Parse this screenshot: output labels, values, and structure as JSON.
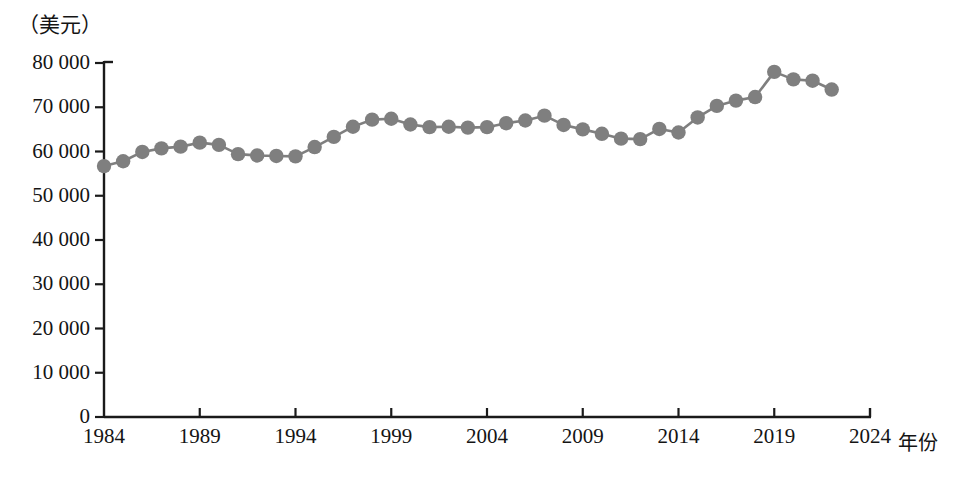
{
  "chart_data": {
    "type": "line",
    "title": "",
    "subtitle": "",
    "unit_label": "（美元）",
    "xlabel": "年份",
    "ylabel": "",
    "grid": false,
    "legend": false,
    "legend_position": "none",
    "marker": "circle",
    "series_color": "#7f7f7f",
    "axis_color": "#1a1a1a",
    "xlim": [
      1984,
      2024
    ],
    "ylim": [
      0,
      80000
    ],
    "xticks": [
      1984,
      1989,
      1994,
      1999,
      2004,
      2009,
      2014,
      2019,
      2024
    ],
    "xtick_labels": [
      "1984",
      "1989",
      "1994",
      "1999",
      "2004",
      "2009",
      "2014",
      "2019",
      "2024"
    ],
    "yticks": [
      0,
      10000,
      20000,
      30000,
      40000,
      50000,
      60000,
      70000,
      80000
    ],
    "ytick_labels": [
      "0",
      "10 000",
      "20 000",
      "30 000",
      "40 000",
      "50 000",
      "60 000",
      "70 000",
      "80 000"
    ],
    "x": [
      1984,
      1985,
      1986,
      1987,
      1988,
      1989,
      1990,
      1991,
      1992,
      1993,
      1994,
      1995,
      1996,
      1997,
      1998,
      1999,
      2000,
      2001,
      2002,
      2003,
      2004,
      2005,
      2006,
      2007,
      2008,
      2009,
      2010,
      2011,
      2012,
      2013,
      2014,
      2015,
      2016,
      2017,
      2018,
      2019,
      2020,
      2021,
      2022
    ],
    "values": [
      56700,
      57800,
      59900,
      60700,
      61100,
      62000,
      61500,
      59400,
      59100,
      59000,
      58900,
      61000,
      63300,
      65600,
      67200,
      67400,
      66100,
      65500,
      65600,
      65400,
      65500,
      66400,
      67000,
      68100,
      66000,
      65000,
      64000,
      62900,
      62800,
      65100,
      64300,
      67700,
      70300,
      71500,
      72300,
      78000,
      76300,
      76000,
      74000
    ]
  }
}
